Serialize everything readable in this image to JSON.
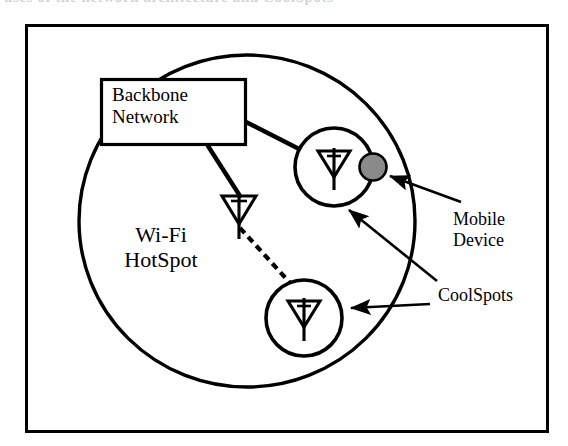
{
  "figure": {
    "kind": "network-diagram",
    "caption_sliver": "uses of the network architecture and CoolSpots",
    "colors": {
      "stroke": "#000000",
      "background": "#ffffff",
      "mobile_device_fill": "#8a8a8a",
      "border": "#000000"
    },
    "frame": {
      "x": 25,
      "y": 24,
      "width": 523,
      "height": 408,
      "stroke_width": 3
    },
    "hotspot_circle": {
      "label": "Wi-Fi HotSpot",
      "cx": 247,
      "cy": 221,
      "rx": 168,
      "ry": 166,
      "stroke_width": 3
    },
    "backbone_box": {
      "label": "Backbone\nNetwork",
      "x": 100,
      "y": 78,
      "width": 146,
      "height": 67,
      "stroke_width": 3
    },
    "coolspots": [
      {
        "id": "coolspot-upper",
        "cx": 334,
        "cy": 167,
        "r": 40,
        "antenna": "antenna-icon"
      },
      {
        "id": "coolspot-lower",
        "cx": 304,
        "cy": 318,
        "r": 39,
        "antenna": "antenna-icon"
      }
    ],
    "standalone_antenna": {
      "id": "antenna-middle",
      "cx": 238,
      "cy": 211
    },
    "mobile_device": {
      "label": "Mobile\nDevice",
      "cx": 373,
      "cy": 167,
      "r": 14,
      "fill": "#8a8a8a"
    },
    "links": [
      {
        "id": "backbone-to-upper-coolspot",
        "style": "solid",
        "from": "Backbone Network",
        "to": "coolspot-upper"
      },
      {
        "id": "backbone-to-middle-antenna",
        "style": "solid",
        "from": "Backbone Network",
        "to": "antenna-middle"
      },
      {
        "id": "middle-antenna-to-lower-coolspot",
        "style": "dashed",
        "from": "antenna-middle",
        "to": "coolspot-lower"
      }
    ],
    "callouts": [
      {
        "id": "callout-mobile-device",
        "label": "Mobile\nDevice",
        "points_to": "mobile_device"
      },
      {
        "id": "callout-coolspot-upper",
        "label": "CoolSpots",
        "points_to": "coolspot-upper"
      },
      {
        "id": "callout-coolspot-lower",
        "label": "CoolSpots",
        "points_to": "coolspot-lower"
      }
    ],
    "labels": {
      "backbone": "Backbone\nNetwork",
      "hotspot": "Wi-Fi\nHotSpot",
      "mobile_device": "Mobile\nDevice",
      "coolspots": "CoolSpots"
    }
  }
}
